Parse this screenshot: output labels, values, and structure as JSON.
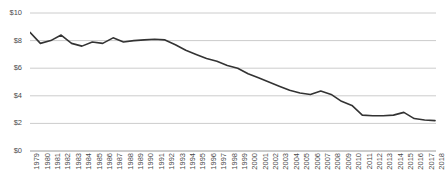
{
  "chart_data": {
    "type": "line",
    "title": "",
    "subtitle": "",
    "xlabel": "",
    "ylabel": "",
    "ylim": [
      0,
      10
    ],
    "ytick_values": [
      10,
      8,
      6,
      4,
      2,
      0
    ],
    "ytick_labels": [
      "$10",
      "$8",
      "$6",
      "$4",
      "$2",
      "$0"
    ],
    "grid": true,
    "grid_axis": "y",
    "legend": false,
    "legend_position": "none",
    "line_color": "#333333",
    "grid_color": "#cccccc",
    "tick_label_color": "#4a4a4a",
    "x_label_rotation": -90,
    "categories": [
      "1979",
      "1980",
      "1981",
      "1982",
      "1983",
      "1984",
      "1985",
      "1986",
      "1987",
      "1988",
      "1989",
      "1990",
      "1991",
      "1992",
      "1993",
      "1994",
      "1995",
      "1996",
      "1997",
      "1998",
      "1999",
      "2000",
      "2001",
      "2002",
      "2003",
      "2004",
      "2005",
      "2006",
      "2007",
      "2008",
      "2009",
      "2010",
      "2011",
      "2012",
      "2013",
      "2014",
      "2015",
      "2016",
      "2017",
      "2018"
    ],
    "values": [
      8.6,
      7.8,
      8.0,
      8.4,
      7.8,
      7.6,
      7.9,
      7.8,
      8.2,
      7.9,
      8.0,
      8.05,
      8.1,
      8.05,
      7.7,
      7.3,
      7.0,
      6.7,
      6.5,
      6.2,
      6.0,
      5.6,
      5.3,
      5.0,
      4.7,
      4.4,
      4.2,
      4.1,
      4.35,
      4.1,
      3.6,
      3.3,
      2.6,
      2.55,
      2.55,
      2.6,
      2.8,
      2.35,
      2.25,
      2.2
    ],
    "series": [
      {
        "name": "value",
        "values": [
          8.6,
          7.8,
          8.0,
          8.4,
          7.8,
          7.6,
          7.9,
          7.8,
          8.2,
          7.9,
          8.0,
          8.05,
          8.1,
          8.05,
          7.7,
          7.3,
          7.0,
          6.7,
          6.5,
          6.2,
          6.0,
          5.6,
          5.3,
          5.0,
          4.7,
          4.4,
          4.2,
          4.1,
          4.35,
          4.1,
          3.6,
          3.3,
          2.6,
          2.55,
          2.55,
          2.6,
          2.8,
          2.35,
          2.25,
          2.2
        ]
      }
    ]
  }
}
